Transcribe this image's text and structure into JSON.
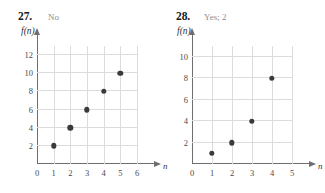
{
  "page": {
    "background": "#ffffff",
    "marker_color": "#3a3a3e",
    "grid_color": "#dcdcdc",
    "axis_color": "#6e6e72",
    "answer_color": "#8d8d90"
  },
  "problems": [
    {
      "number": "27.",
      "answer": "No",
      "ylabel": "f(n)",
      "xlabel": "n"
    },
    {
      "number": "28.",
      "answer": "Yes; 2",
      "ylabel": "f(n)",
      "xlabel": "n"
    }
  ],
  "chart_data": [
    {
      "type": "scatter",
      "title": "27.",
      "annotation": "No",
      "xlabel": "n",
      "ylabel": "f(n)",
      "x": [
        1,
        2,
        3,
        4,
        5
      ],
      "values": [
        2,
        4,
        6,
        8,
        10
      ],
      "points": [
        [
          1,
          2
        ],
        [
          2,
          4
        ],
        [
          3,
          6
        ],
        [
          4,
          8
        ],
        [
          5,
          10
        ]
      ],
      "xlim": [
        0,
        6
      ],
      "ylim": [
        0,
        13
      ],
      "xticks": [
        0,
        1,
        2,
        3,
        4,
        5,
        6
      ],
      "yticks": [
        2,
        4,
        6,
        8,
        10,
        12
      ],
      "xtick_labels": [
        "0",
        "1",
        "2",
        "3",
        "4",
        "5",
        "6"
      ],
      "ytick_labels": [
        "2",
        "4",
        "6",
        "8",
        "10",
        "12"
      ],
      "grid": true,
      "legend": "none"
    },
    {
      "type": "scatter",
      "title": "28.",
      "annotation": "Yes; 2",
      "xlabel": "n",
      "ylabel": "f(n)",
      "x": [
        1,
        2,
        3,
        4
      ],
      "values": [
        1,
        2,
        4,
        8
      ],
      "points": [
        [
          1,
          1
        ],
        [
          2,
          2
        ],
        [
          3,
          4
        ],
        [
          4,
          8
        ]
      ],
      "xlim": [
        0,
        5
      ],
      "ylim": [
        0,
        11
      ],
      "xticks": [
        0,
        1,
        2,
        3,
        4,
        5
      ],
      "yticks": [
        2,
        4,
        6,
        8,
        10
      ],
      "xtick_labels": [
        "0",
        "1",
        "2",
        "3",
        "4",
        "5"
      ],
      "ytick_labels": [
        "2",
        "4",
        "6",
        "8",
        "10"
      ],
      "grid": true,
      "legend": "none"
    }
  ]
}
